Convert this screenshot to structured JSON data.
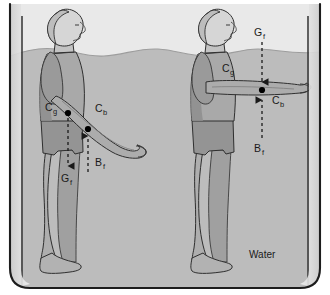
{
  "figure": {
    "caption_label": "Water",
    "colors": {
      "tank_outline": "#1d1d1d",
      "air_background": "#e8e8e8",
      "water_fill": "#b9b9b9",
      "body_fill": "#a6a6a6",
      "body_shadow": "#8f8f8f",
      "skin_fill": "#d4d4d4",
      "outline": "#2b2b2b",
      "marker": "#000000",
      "label_text": "#1a1a1a"
    },
    "tank": {
      "name": "water-tank",
      "water_surface_label": "water-surface-wavy-line"
    },
    "subjects": [
      {
        "name": "left-figure",
        "pose": "arms-angled-downward-forward",
        "markers": [
          {
            "label": "C",
            "sub": "g",
            "meaning": "center-of-gravity",
            "x": 68,
            "y": 113
          },
          {
            "label": "C",
            "sub": "b",
            "meaning": "center-of-buoyancy",
            "x": 88,
            "y": 129
          }
        ],
        "forces": [
          {
            "label": "G",
            "sub": "f",
            "meaning": "gravitational-force",
            "direction": "down"
          },
          {
            "label": "B",
            "sub": "f",
            "meaning": "buoyant-force",
            "direction": "up"
          }
        ]
      },
      {
        "name": "right-figure",
        "pose": "arms-extended-horizontal",
        "markers": [
          {
            "label": "C",
            "sub": "g",
            "meaning": "center-of-gravity",
            "x": 262,
            "y": 90
          },
          {
            "label": "C",
            "sub": "b",
            "meaning": "center-of-buoyancy",
            "x": 262,
            "y": 90
          }
        ],
        "forces": [
          {
            "label": "G",
            "sub": "f",
            "meaning": "gravitational-force",
            "direction": "down"
          },
          {
            "label": "B",
            "sub": "f",
            "meaning": "buoyant-force",
            "direction": "up"
          }
        ]
      }
    ],
    "labels": {
      "left_cg": {
        "text": "C",
        "sub": "g"
      },
      "left_cb": {
        "text": "C",
        "sub": "b"
      },
      "left_gf": {
        "text": "G",
        "sub": "f"
      },
      "left_bf": {
        "text": "B",
        "sub": "f"
      },
      "right_cg": {
        "text": "C",
        "sub": "g"
      },
      "right_cb": {
        "text": "C",
        "sub": "b"
      },
      "right_gf": {
        "text": "G",
        "sub": "f"
      },
      "right_bf": {
        "text": "B",
        "sub": "f"
      }
    }
  }
}
